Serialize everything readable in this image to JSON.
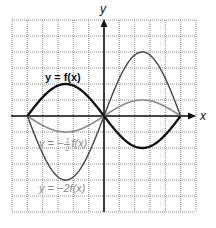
{
  "chart_data": {
    "type": "line",
    "title": "",
    "xlabel": "x",
    "ylabel": "y",
    "xlim": [
      -6,
      6
    ],
    "ylim": [
      -6,
      6
    ],
    "grid": true,
    "grid_style": "dotted",
    "x_scale_px": 15.33,
    "y_scale_px": 16,
    "origin_px": [
      104,
      116
    ],
    "series": [
      {
        "name": "y = f(x)",
        "label_plain": "y = f(x)",
        "color": "#111111",
        "width": 2.3,
        "x": [
          -5,
          -2.5,
          0,
          2.5,
          5
        ],
        "y": [
          0,
          2,
          0,
          -2,
          0
        ]
      },
      {
        "name": "y = -1/2 f(x)",
        "label_plain": "y = −½f(x)",
        "color": "#8a8a8a",
        "width": 1.6,
        "x": [
          -5,
          -2.5,
          0,
          2.5,
          5
        ],
        "y": [
          0,
          -1,
          0,
          1,
          0
        ]
      },
      {
        "name": "y = -2f(x)",
        "label_plain": "y = −2f(x)",
        "color": "#444444",
        "width": 1.4,
        "x": [
          -5,
          -2.5,
          0,
          2.5,
          5
        ],
        "y": [
          0,
          -4,
          0,
          4,
          0
        ]
      }
    ]
  },
  "labels": {
    "x_axis": "x",
    "y_axis": "y",
    "f": "y = f(x)",
    "half_prefix": "y = −",
    "half_num": "1",
    "half_den": "2",
    "half_suffix": "f(x)",
    "double": "y = −2f(x)"
  }
}
